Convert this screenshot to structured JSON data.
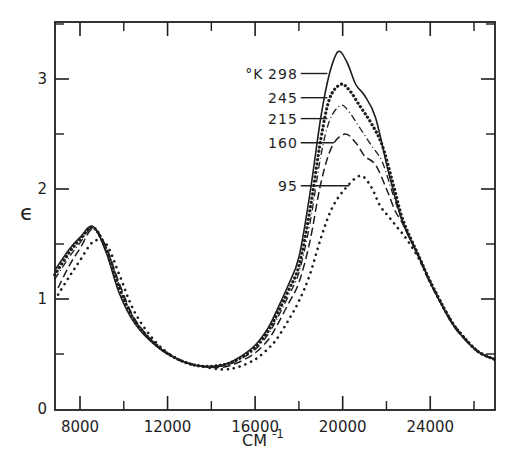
{
  "chart_data": {
    "type": "line",
    "title": "",
    "xlabel": "CM",
    "xlabel_superscript": "-1",
    "ylabel": "ϵ",
    "xlim": [
      6850,
      27000
    ],
    "ylim": [
      0,
      3.52
    ],
    "x_ticks_major": [
      8000,
      12000,
      16000,
      20000,
      24000
    ],
    "x_tick_labels": [
      "8000",
      "12000",
      "16000",
      "20000",
      "24000"
    ],
    "x_ticks_minor": [
      10000,
      14000,
      18000,
      22000,
      26000
    ],
    "y_ticks_major": [
      0,
      1,
      2,
      3
    ],
    "y_tick_labels": [
      "0",
      "1",
      "2",
      "3"
    ],
    "y_ticks_minor": [
      0.5,
      1.5,
      2.5,
      3.5
    ],
    "grid": false,
    "legend": {
      "position": "inside, upper center with leader lines to curves",
      "unit_label": "°K",
      "entries": [
        "298",
        "245",
        "215",
        "160",
        "95"
      ]
    },
    "series": [
      {
        "name": "298",
        "style": "solid",
        "points": [
          [
            6850,
            1.26
          ],
          [
            7500,
            1.45
          ],
          [
            8000,
            1.56
          ],
          [
            8600,
            1.66
          ],
          [
            9200,
            1.42
          ],
          [
            9800,
            1.05
          ],
          [
            10500,
            0.78
          ],
          [
            11500,
            0.57
          ],
          [
            12500,
            0.45
          ],
          [
            13500,
            0.39
          ],
          [
            14500,
            0.4
          ],
          [
            15200,
            0.46
          ],
          [
            16000,
            0.58
          ],
          [
            16600,
            0.74
          ],
          [
            17000,
            0.9
          ],
          [
            17500,
            1.12
          ],
          [
            18000,
            1.38
          ],
          [
            18500,
            1.95
          ],
          [
            19000,
            2.65
          ],
          [
            19400,
            3.05
          ],
          [
            19800,
            3.25
          ],
          [
            20200,
            3.15
          ],
          [
            20600,
            2.95
          ],
          [
            21000,
            2.85
          ],
          [
            21500,
            2.65
          ],
          [
            22100,
            2.15
          ],
          [
            22750,
            1.69
          ],
          [
            23500,
            1.38
          ],
          [
            24000,
            1.15
          ],
          [
            24900,
            0.81
          ],
          [
            25500,
            0.65
          ],
          [
            26200,
            0.52
          ],
          [
            26950,
            0.45
          ]
        ]
      },
      {
        "name": "245",
        "style": "dotted-heavy",
        "points": [
          [
            6850,
            1.22
          ],
          [
            7500,
            1.42
          ],
          [
            8000,
            1.54
          ],
          [
            8600,
            1.65
          ],
          [
            9200,
            1.45
          ],
          [
            9800,
            1.1
          ],
          [
            10500,
            0.8
          ],
          [
            11500,
            0.58
          ],
          [
            12500,
            0.45
          ],
          [
            13500,
            0.39
          ],
          [
            14500,
            0.4
          ],
          [
            15200,
            0.45
          ],
          [
            16000,
            0.56
          ],
          [
            16600,
            0.71
          ],
          [
            17000,
            0.86
          ],
          [
            17500,
            1.07
          ],
          [
            18000,
            1.3
          ],
          [
            18500,
            1.8
          ],
          [
            19000,
            2.45
          ],
          [
            19400,
            2.82
          ],
          [
            19900,
            2.95
          ],
          [
            20300,
            2.9
          ],
          [
            20800,
            2.75
          ],
          [
            21300,
            2.6
          ],
          [
            21800,
            2.4
          ],
          [
            22300,
            2.05
          ],
          [
            22750,
            1.72
          ],
          [
            23500,
            1.38
          ],
          [
            24000,
            1.16
          ],
          [
            24900,
            0.82
          ],
          [
            25500,
            0.66
          ],
          [
            26200,
            0.52
          ],
          [
            26950,
            0.45
          ]
        ]
      },
      {
        "name": "215",
        "style": "dash-dot",
        "points": [
          [
            6850,
            1.18
          ],
          [
            7500,
            1.38
          ],
          [
            8000,
            1.51
          ],
          [
            8600,
            1.65
          ],
          [
            9200,
            1.46
          ],
          [
            9800,
            1.12
          ],
          [
            10500,
            0.81
          ],
          [
            11500,
            0.58
          ],
          [
            12500,
            0.45
          ],
          [
            13500,
            0.39
          ],
          [
            14500,
            0.39
          ],
          [
            15200,
            0.44
          ],
          [
            16000,
            0.54
          ],
          [
            16600,
            0.68
          ],
          [
            17000,
            0.82
          ],
          [
            17500,
            1.02
          ],
          [
            18000,
            1.24
          ],
          [
            18500,
            1.68
          ],
          [
            19000,
            2.3
          ],
          [
            19400,
            2.62
          ],
          [
            19900,
            2.76
          ],
          [
            20300,
            2.7
          ],
          [
            20800,
            2.55
          ],
          [
            21300,
            2.4
          ],
          [
            21800,
            2.25
          ],
          [
            22300,
            1.95
          ],
          [
            22750,
            1.7
          ],
          [
            23500,
            1.38
          ],
          [
            24000,
            1.16
          ],
          [
            24900,
            0.82
          ],
          [
            25500,
            0.66
          ],
          [
            26200,
            0.52
          ],
          [
            26950,
            0.45
          ]
        ]
      },
      {
        "name": "160",
        "style": "dashed",
        "points": [
          [
            7000,
            1.1
          ],
          [
            7500,
            1.3
          ],
          [
            8000,
            1.46
          ],
          [
            8600,
            1.64
          ],
          [
            9200,
            1.47
          ],
          [
            9800,
            1.14
          ],
          [
            10500,
            0.82
          ],
          [
            11500,
            0.58
          ],
          [
            12500,
            0.45
          ],
          [
            13500,
            0.39
          ],
          [
            14500,
            0.38
          ],
          [
            15200,
            0.42
          ],
          [
            16000,
            0.51
          ],
          [
            16600,
            0.63
          ],
          [
            17000,
            0.76
          ],
          [
            17500,
            0.95
          ],
          [
            18000,
            1.15
          ],
          [
            18500,
            1.52
          ],
          [
            19000,
            2.05
          ],
          [
            19500,
            2.38
          ],
          [
            20100,
            2.5
          ],
          [
            20600,
            2.42
          ],
          [
            21000,
            2.3
          ],
          [
            21500,
            2.22
          ],
          [
            22000,
            2.0
          ],
          [
            22400,
            1.8
          ],
          [
            22750,
            1.68
          ],
          [
            23500,
            1.37
          ],
          [
            24000,
            1.15
          ],
          [
            24900,
            0.81
          ],
          [
            25500,
            0.65
          ],
          [
            26200,
            0.52
          ],
          [
            26950,
            0.45
          ]
        ]
      },
      {
        "name": "95",
        "style": "dotted-sparse",
        "points": [
          [
            7000,
            1.04
          ],
          [
            7500,
            1.2
          ],
          [
            8000,
            1.35
          ],
          [
            8600,
            1.52
          ],
          [
            9200,
            1.5
          ],
          [
            9800,
            1.22
          ],
          [
            10500,
            0.88
          ],
          [
            11500,
            0.6
          ],
          [
            12500,
            0.45
          ],
          [
            13500,
            0.39
          ],
          [
            14500,
            0.36
          ],
          [
            15200,
            0.38
          ],
          [
            16000,
            0.45
          ],
          [
            16600,
            0.55
          ],
          [
            17000,
            0.64
          ],
          [
            17500,
            0.8
          ],
          [
            18000,
            0.98
          ],
          [
            18500,
            1.22
          ],
          [
            19000,
            1.55
          ],
          [
            19500,
            1.82
          ],
          [
            20100,
            2.0
          ],
          [
            20800,
            2.12
          ],
          [
            21300,
            2.02
          ],
          [
            21700,
            1.85
          ],
          [
            22100,
            1.75
          ],
          [
            22500,
            1.65
          ],
          [
            22900,
            1.55
          ],
          [
            23500,
            1.36
          ],
          [
            24000,
            1.15
          ],
          [
            24900,
            0.82
          ],
          [
            25500,
            0.66
          ],
          [
            26200,
            0.52
          ],
          [
            26950,
            0.45
          ]
        ]
      }
    ],
    "leader_lines": [
      {
        "label": "298",
        "label_x": 19000,
        "label_y": 3.05,
        "end_x": 19300
      },
      {
        "label": "245",
        "label_x": 19000,
        "label_y": 2.83,
        "end_x": 19300
      },
      {
        "label": "215",
        "label_x": 19000,
        "label_y": 2.64,
        "end_x": 19300
      },
      {
        "label": "160",
        "label_x": 19000,
        "label_y": 2.42,
        "end_x": 19600
      },
      {
        "label": "95",
        "label_x": 19000,
        "label_y": 2.03,
        "end_x": 20300
      }
    ]
  },
  "plot_frame": {
    "left_px": 55,
    "right_px": 495,
    "top_px": 22,
    "bottom_px": 410,
    "x_px_per_unit": 0.02189,
    "x_ref_value": 8000,
    "x_ref_px": 80,
    "y_px_per_unit": 110,
    "y_zero_px": 409
  }
}
